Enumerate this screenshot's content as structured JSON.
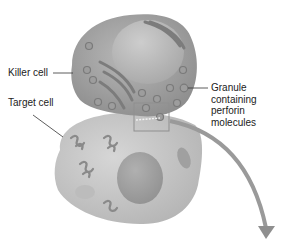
{
  "figure": {
    "labels": {
      "killer_cell": "Killer cell",
      "target_cell": "Target cell",
      "granule_line1": "Granule",
      "granule_line2": "containing",
      "granule_line3": "perforin",
      "granule_line4": "molecules"
    },
    "colors": {
      "killer_cell_fill": "#a9a9a9",
      "killer_nucleus": "#bcbcbc",
      "target_cell_fill": "#c8c8c8",
      "target_nucleus": "#a4a4a4",
      "arrow": "#9a9a9a",
      "label_text": "#222222"
    }
  }
}
